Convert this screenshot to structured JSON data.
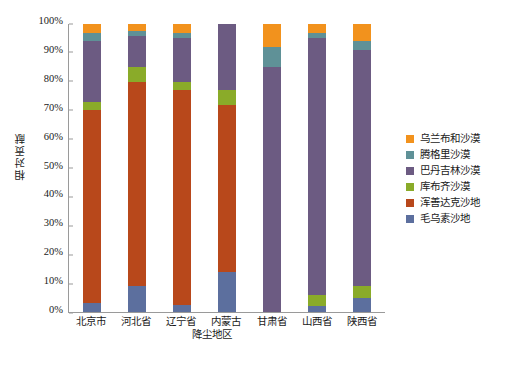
{
  "chart_data": {
    "type": "bar",
    "stacked": true,
    "stack_mode": "percent",
    "title": "",
    "xlabel": "降尘地区",
    "ylabel": "相对贡献",
    "ylim": [
      0,
      100
    ],
    "ytick_labels": [
      "0%",
      "10%",
      "20%",
      "30%",
      "40%",
      "50%",
      "60%",
      "70%",
      "80%",
      "90%",
      "100%"
    ],
    "ytick_values": [
      0,
      10,
      20,
      30,
      40,
      50,
      60,
      70,
      80,
      90,
      100
    ],
    "grid": false,
    "legend_position": "right",
    "categories": [
      "北京市",
      "河北省",
      "辽宁省",
      "内蒙古",
      "甘肃省",
      "山西省",
      "陕西省"
    ],
    "series": [
      {
        "name": "毛乌素沙地",
        "color": "#5c6f9e",
        "values": [
          3,
          9,
          2.5,
          14,
          0,
          2,
          5
        ]
      },
      {
        "name": "浑善达克沙地",
        "color": "#b8481b",
        "values": [
          67,
          71,
          74.5,
          58,
          0,
          0,
          0
        ]
      },
      {
        "name": "库布齐沙漠",
        "color": "#8aab29",
        "values": [
          3,
          5,
          3,
          5,
          0,
          4,
          4
        ]
      },
      {
        "name": "巴丹吉林沙漠",
        "color": "#6c5b82",
        "values": [
          21,
          11,
          15,
          23,
          85,
          89,
          82
        ]
      },
      {
        "name": "腾格里沙漠",
        "color": "#5f9197",
        "values": [
          3,
          1.5,
          2,
          0,
          7,
          2,
          3
        ]
      },
      {
        "name": "乌兰布和沙漠",
        "color": "#f2921d",
        "values": [
          3,
          2.5,
          3,
          0,
          8,
          3,
          6
        ]
      }
    ],
    "legend_order": [
      "乌兰布和沙漠",
      "腾格里沙漠",
      "巴丹吉林沙漠",
      "库布齐沙漠",
      "浑善达克沙地",
      "毛乌素沙地"
    ]
  }
}
